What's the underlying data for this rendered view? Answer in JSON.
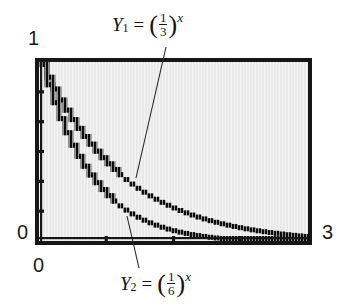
{
  "figure": {
    "kind": "graphing-calculator-plot",
    "background_color": "#ffffff",
    "plot_fill_color": "#e9e9e9",
    "frame_color": "#161616",
    "curve_color": "#0d0d0d"
  },
  "axes": {
    "y_top_label": "1",
    "y_zero_label": "0",
    "x_zero_label": "0",
    "x_max_label": "3",
    "xlim": [
      0,
      3
    ],
    "ylim": [
      0,
      1
    ],
    "y_tick_count": 5,
    "x_tick_count": 3
  },
  "annotations": {
    "y1": {
      "name": "Y",
      "subscript": "1",
      "equals": "=",
      "numerator": "1",
      "denominator": "3",
      "exponent": "x",
      "text": "Y1 = (1/3)^x"
    },
    "y2": {
      "name": "Y",
      "subscript": "2",
      "equals": "=",
      "numerator": "1",
      "denominator": "6",
      "exponent": "x",
      "text": "Y2 = (1/6)^x"
    }
  },
  "chart_data": {
    "type": "line",
    "title": "",
    "xlabel": "",
    "ylabel": "",
    "xlim": [
      0,
      3
    ],
    "ylim": [
      0,
      1
    ],
    "grid": false,
    "legend": "annotated-in-plot",
    "x": [
      0,
      0.15,
      0.3,
      0.45,
      0.6,
      0.75,
      0.9,
      1.05,
      1.2,
      1.35,
      1.5,
      1.65,
      1.8,
      1.95,
      2.1,
      2.25,
      2.4,
      2.55,
      2.7,
      2.85,
      3
    ],
    "series": [
      {
        "name": "Y1 = (1/3)^x",
        "base": 0.3333333,
        "values": [
          1,
          0.848,
          0.719,
          0.61,
          0.518,
          0.439,
          0.372,
          0.316,
          0.268,
          0.227,
          0.192,
          0.163,
          0.139,
          0.118,
          0.1,
          0.085,
          0.072,
          0.061,
          0.052,
          0.044,
          0.037
        ]
      },
      {
        "name": "Y2 = (1/6)^x",
        "base": 0.1666667,
        "values": [
          1,
          0.765,
          0.586,
          0.448,
          0.343,
          0.262,
          0.201,
          0.154,
          0.118,
          0.09,
          0.069,
          0.053,
          0.04,
          0.031,
          0.024,
          0.018,
          0.014,
          0.011,
          0.008,
          0.006,
          0.005
        ]
      }
    ]
  }
}
